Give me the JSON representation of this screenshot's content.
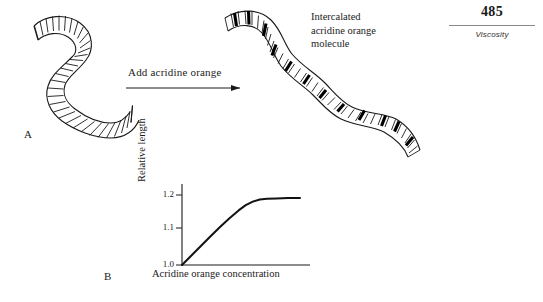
{
  "page": {
    "folio": "485",
    "running_head": "Viscosity"
  },
  "panels": {
    "a_label": "A",
    "b_label": "B"
  },
  "arrow": {
    "label": "Add acridine orange"
  },
  "callout": {
    "line1": "Intercalated",
    "line2": "acridine orange",
    "line3": "molecule"
  },
  "chart_data": {
    "type": "line",
    "title": "",
    "xlabel": "Acridine orange concentration",
    "ylabel": "Relative length",
    "ytick_labels": [
      "1.0",
      "1.1",
      "1.2"
    ],
    "ytick_values": [
      1.0,
      1.1,
      1.2
    ],
    "ylim": [
      1.0,
      1.23
    ],
    "xlim": [
      0,
      1
    ],
    "xtick_labels": [],
    "grid": false,
    "legend": null,
    "series": [
      {
        "name": "Relative length vs acridine orange concentration",
        "x": [
          0.0,
          0.08,
          0.16,
          0.24,
          0.32,
          0.4,
          0.48,
          0.54,
          0.6,
          0.66,
          0.72,
          0.8,
          0.9,
          1.0
        ],
        "y": [
          1.0,
          1.027,
          1.054,
          1.081,
          1.107,
          1.132,
          1.155,
          1.17,
          1.18,
          1.186,
          1.188,
          1.189,
          1.19,
          1.19
        ]
      }
    ],
    "plateau_value": 1.19,
    "start_value": 1.0
  },
  "colors": {
    "ink": "#1a1a1a",
    "rule": "#8a8a8a",
    "intercalated_fill": "#000000",
    "strand_fill": "#ffffff"
  },
  "icons": {
    "arrow": "right-arrow-icon",
    "dna_relaxed": "coiled-dna-icon",
    "dna_extended": "extended-dna-icon"
  }
}
